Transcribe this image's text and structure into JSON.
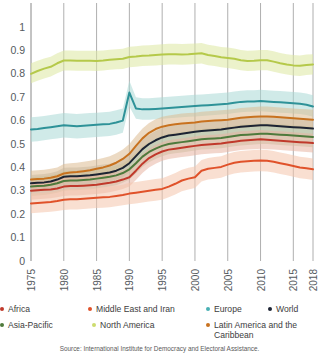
{
  "chart_data": {
    "type": "line",
    "title": "",
    "subtitle": "",
    "xlabel": "",
    "ylabel": "",
    "xlim": [
      1975,
      2018
    ],
    "ylim": [
      0,
      1
    ],
    "grid": "vertical",
    "legend_position": "bottom",
    "y_ticks": [
      "0",
      "0.1",
      "0.2",
      "0.3",
      "0.4",
      "0.5",
      "0.6",
      "0.7",
      "0.8",
      "0.9",
      "1"
    ],
    "x_ticks": [
      "1975",
      "1980",
      "1985",
      "1990",
      "1995",
      "2000",
      "2005",
      "2010",
      "2015",
      "2018"
    ],
    "x": [
      1975,
      1976,
      1977,
      1978,
      1979,
      1980,
      1981,
      1982,
      1983,
      1984,
      1985,
      1986,
      1987,
      1988,
      1989,
      1990,
      1991,
      1992,
      1993,
      1994,
      1995,
      1996,
      1997,
      1998,
      1999,
      2000,
      2001,
      2002,
      2003,
      2004,
      2005,
      2006,
      2007,
      2008,
      2009,
      2010,
      2011,
      2012,
      2013,
      2014,
      2015,
      2016,
      2017,
      2018
    ],
    "series": [
      {
        "name": "North America",
        "color": "#b5c94a",
        "band_color": "#dce8a0",
        "values": [
          0.8,
          0.812,
          0.822,
          0.83,
          0.845,
          0.857,
          0.857,
          0.856,
          0.856,
          0.856,
          0.855,
          0.857,
          0.86,
          0.862,
          0.864,
          0.872,
          0.874,
          0.877,
          0.878,
          0.88,
          0.882,
          0.884,
          0.884,
          0.883,
          0.884,
          0.886,
          0.888,
          0.88,
          0.876,
          0.871,
          0.868,
          0.864,
          0.858,
          0.855,
          0.856,
          0.858,
          0.858,
          0.852,
          0.845,
          0.84,
          0.836,
          0.834,
          0.838,
          0.84
        ],
        "band_low": [
          0.76,
          0.77,
          0.78,
          0.788,
          0.802,
          0.814,
          0.814,
          0.813,
          0.813,
          0.813,
          0.812,
          0.814,
          0.817,
          0.819,
          0.821,
          0.828,
          0.83,
          0.833,
          0.834,
          0.836,
          0.838,
          0.84,
          0.84,
          0.839,
          0.84,
          0.842,
          0.844,
          0.837,
          0.833,
          0.828,
          0.825,
          0.821,
          0.815,
          0.812,
          0.813,
          0.815,
          0.815,
          0.809,
          0.802,
          0.797,
          0.793,
          0.791,
          0.795,
          0.797
        ],
        "band_high": [
          0.845,
          0.856,
          0.865,
          0.873,
          0.888,
          0.9,
          0.9,
          0.899,
          0.899,
          0.899,
          0.898,
          0.9,
          0.903,
          0.905,
          0.907,
          0.916,
          0.918,
          0.921,
          0.922,
          0.924,
          0.926,
          0.928,
          0.928,
          0.927,
          0.928,
          0.93,
          0.932,
          0.924,
          0.92,
          0.915,
          0.912,
          0.908,
          0.902,
          0.899,
          0.9,
          0.902,
          0.902,
          0.896,
          0.889,
          0.884,
          0.88,
          0.878,
          0.882,
          0.884
        ]
      },
      {
        "name": "Europe",
        "color": "#2e9298",
        "band_color": "#a9d8d6",
        "values": [
          0.562,
          0.564,
          0.568,
          0.572,
          0.576,
          0.58,
          0.578,
          0.576,
          0.578,
          0.58,
          0.582,
          0.584,
          0.586,
          0.592,
          0.6,
          0.72,
          0.652,
          0.648,
          0.648,
          0.65,
          0.652,
          0.654,
          0.656,
          0.658,
          0.66,
          0.662,
          0.664,
          0.666,
          0.668,
          0.67,
          0.672,
          0.676,
          0.68,
          0.682,
          0.682,
          0.684,
          0.682,
          0.68,
          0.678,
          0.676,
          0.674,
          0.672,
          0.668,
          0.66
        ],
        "band_low": [
          0.51,
          0.512,
          0.516,
          0.52,
          0.524,
          0.528,
          0.526,
          0.524,
          0.526,
          0.528,
          0.53,
          0.532,
          0.534,
          0.54,
          0.548,
          0.66,
          0.608,
          0.604,
          0.604,
          0.606,
          0.608,
          0.61,
          0.612,
          0.614,
          0.616,
          0.618,
          0.62,
          0.622,
          0.624,
          0.626,
          0.628,
          0.632,
          0.636,
          0.638,
          0.638,
          0.64,
          0.638,
          0.636,
          0.634,
          0.632,
          0.63,
          0.628,
          0.624,
          0.616
        ],
        "band_high": [
          0.614,
          0.616,
          0.62,
          0.624,
          0.628,
          0.632,
          0.63,
          0.628,
          0.63,
          0.632,
          0.634,
          0.636,
          0.638,
          0.644,
          0.652,
          0.77,
          0.7,
          0.696,
          0.696,
          0.698,
          0.7,
          0.702,
          0.704,
          0.706,
          0.708,
          0.71,
          0.712,
          0.714,
          0.716,
          0.718,
          0.72,
          0.724,
          0.728,
          0.73,
          0.73,
          0.732,
          0.73,
          0.728,
          0.726,
          0.724,
          0.722,
          0.72,
          0.716,
          0.708
        ]
      },
      {
        "name": "World",
        "color": "#1d2433",
        "band_color": "#b7b7ad",
        "values": [
          0.332,
          0.334,
          0.336,
          0.34,
          0.348,
          0.36,
          0.362,
          0.362,
          0.364,
          0.366,
          0.37,
          0.374,
          0.378,
          0.386,
          0.398,
          0.418,
          0.448,
          0.478,
          0.5,
          0.516,
          0.528,
          0.536,
          0.54,
          0.544,
          0.548,
          0.552,
          0.556,
          0.558,
          0.56,
          0.562,
          0.566,
          0.57,
          0.574,
          0.576,
          0.578,
          0.58,
          0.58,
          0.578,
          0.576,
          0.574,
          0.572,
          0.57,
          0.568,
          0.566
        ],
        "band_low": [
          0.296,
          0.298,
          0.3,
          0.304,
          0.312,
          0.322,
          0.324,
          0.324,
          0.326,
          0.328,
          0.332,
          0.336,
          0.34,
          0.348,
          0.358,
          0.378,
          0.408,
          0.438,
          0.46,
          0.476,
          0.488,
          0.496,
          0.5,
          0.504,
          0.508,
          0.512,
          0.516,
          0.518,
          0.52,
          0.522,
          0.526,
          0.53,
          0.534,
          0.536,
          0.538,
          0.54,
          0.54,
          0.538,
          0.536,
          0.534,
          0.532,
          0.53,
          0.528,
          0.526
        ],
        "band_high": [
          0.368,
          0.37,
          0.372,
          0.376,
          0.384,
          0.398,
          0.4,
          0.4,
          0.402,
          0.404,
          0.408,
          0.412,
          0.416,
          0.424,
          0.438,
          0.458,
          0.488,
          0.518,
          0.54,
          0.556,
          0.568,
          0.576,
          0.58,
          0.584,
          0.588,
          0.592,
          0.596,
          0.598,
          0.6,
          0.602,
          0.606,
          0.61,
          0.614,
          0.616,
          0.618,
          0.62,
          0.62,
          0.618,
          0.616,
          0.614,
          0.612,
          0.61,
          0.608,
          0.606
        ]
      },
      {
        "name": "Asia-Pacific",
        "color": "#4e7a3c",
        "band_color": "#b9c8a2",
        "values": [
          0.318,
          0.32,
          0.322,
          0.326,
          0.332,
          0.342,
          0.344,
          0.344,
          0.346,
          0.348,
          0.352,
          0.356,
          0.36,
          0.366,
          0.376,
          0.392,
          0.418,
          0.446,
          0.466,
          0.48,
          0.492,
          0.5,
          0.504,
          0.508,
          0.512,
          0.516,
          0.52,
          0.522,
          0.524,
          0.526,
          0.53,
          0.534,
          0.538,
          0.54,
          0.542,
          0.544,
          0.544,
          0.542,
          0.54,
          0.538,
          0.536,
          0.534,
          0.532,
          0.53
        ],
        "band_low": [
          0.278,
          0.28,
          0.282,
          0.286,
          0.292,
          0.3,
          0.302,
          0.302,
          0.304,
          0.306,
          0.31,
          0.314,
          0.318,
          0.324,
          0.334,
          0.348,
          0.374,
          0.402,
          0.422,
          0.436,
          0.448,
          0.456,
          0.46,
          0.464,
          0.468,
          0.472,
          0.476,
          0.478,
          0.48,
          0.482,
          0.486,
          0.49,
          0.494,
          0.496,
          0.498,
          0.5,
          0.5,
          0.498,
          0.496,
          0.494,
          0.492,
          0.49,
          0.488,
          0.486
        ],
        "band_high": [
          0.358,
          0.36,
          0.362,
          0.366,
          0.372,
          0.384,
          0.386,
          0.386,
          0.388,
          0.39,
          0.394,
          0.398,
          0.402,
          0.408,
          0.418,
          0.436,
          0.462,
          0.49,
          0.51,
          0.524,
          0.536,
          0.544,
          0.548,
          0.552,
          0.556,
          0.56,
          0.564,
          0.566,
          0.568,
          0.57,
          0.574,
          0.578,
          0.582,
          0.584,
          0.586,
          0.588,
          0.588,
          0.586,
          0.584,
          0.582,
          0.58,
          0.578,
          0.576,
          0.574
        ]
      },
      {
        "name": "Latin America and the Caribbean",
        "color": "#c8721f",
        "band_color": "#ddbc92",
        "values": [
          0.348,
          0.35,
          0.352,
          0.356,
          0.362,
          0.374,
          0.378,
          0.38,
          0.384,
          0.388,
          0.394,
          0.4,
          0.408,
          0.42,
          0.436,
          0.458,
          0.492,
          0.524,
          0.548,
          0.564,
          0.574,
          0.58,
          0.584,
          0.588,
          0.59,
          0.592,
          0.596,
          0.598,
          0.6,
          0.602,
          0.604,
          0.608,
          0.612,
          0.614,
          0.616,
          0.618,
          0.618,
          0.616,
          0.614,
          0.612,
          0.61,
          0.608,
          0.606,
          0.604
        ],
        "band_low": [
          0.31,
          0.312,
          0.314,
          0.318,
          0.324,
          0.334,
          0.338,
          0.34,
          0.344,
          0.348,
          0.354,
          0.36,
          0.368,
          0.38,
          0.396,
          0.416,
          0.45,
          0.482,
          0.506,
          0.522,
          0.532,
          0.538,
          0.542,
          0.546,
          0.548,
          0.55,
          0.554,
          0.556,
          0.558,
          0.56,
          0.562,
          0.566,
          0.57,
          0.572,
          0.574,
          0.576,
          0.576,
          0.574,
          0.572,
          0.57,
          0.568,
          0.566,
          0.564,
          0.562
        ],
        "band_high": [
          0.386,
          0.388,
          0.39,
          0.394,
          0.4,
          0.414,
          0.418,
          0.42,
          0.424,
          0.428,
          0.434,
          0.44,
          0.448,
          0.46,
          0.476,
          0.5,
          0.534,
          0.566,
          0.59,
          0.606,
          0.616,
          0.622,
          0.626,
          0.63,
          0.632,
          0.634,
          0.638,
          0.64,
          0.642,
          0.644,
          0.646,
          0.65,
          0.654,
          0.656,
          0.658,
          0.66,
          0.66,
          0.658,
          0.656,
          0.654,
          0.652,
          0.65,
          0.648,
          0.646
        ]
      },
      {
        "name": "Africa",
        "color": "#c0392b",
        "band_color": "#e8b5a2",
        "values": [
          0.3,
          0.302,
          0.304,
          0.306,
          0.31,
          0.318,
          0.32,
          0.32,
          0.322,
          0.324,
          0.326,
          0.33,
          0.334,
          0.34,
          0.348,
          0.358,
          0.386,
          0.416,
          0.44,
          0.456,
          0.468,
          0.476,
          0.48,
          0.484,
          0.488,
          0.492,
          0.496,
          0.498,
          0.5,
          0.502,
          0.506,
          0.51,
          0.514,
          0.516,
          0.518,
          0.52,
          0.518,
          0.516,
          0.514,
          0.512,
          0.51,
          0.508,
          0.506,
          0.504
        ],
        "band_low": [
          0.262,
          0.264,
          0.266,
          0.268,
          0.272,
          0.278,
          0.28,
          0.28,
          0.282,
          0.284,
          0.286,
          0.29,
          0.294,
          0.3,
          0.308,
          0.318,
          0.346,
          0.376,
          0.4,
          0.416,
          0.428,
          0.436,
          0.44,
          0.444,
          0.448,
          0.452,
          0.456,
          0.458,
          0.46,
          0.462,
          0.466,
          0.47,
          0.474,
          0.476,
          0.478,
          0.48,
          0.478,
          0.476,
          0.474,
          0.472,
          0.47,
          0.468,
          0.466,
          0.464
        ],
        "band_high": [
          0.338,
          0.34,
          0.342,
          0.344,
          0.348,
          0.358,
          0.36,
          0.36,
          0.362,
          0.364,
          0.366,
          0.37,
          0.374,
          0.38,
          0.388,
          0.398,
          0.426,
          0.456,
          0.48,
          0.496,
          0.508,
          0.516,
          0.52,
          0.524,
          0.528,
          0.532,
          0.536,
          0.538,
          0.54,
          0.542,
          0.546,
          0.55,
          0.554,
          0.556,
          0.558,
          0.56,
          0.558,
          0.556,
          0.554,
          0.552,
          0.55,
          0.548,
          0.546,
          0.544
        ]
      },
      {
        "name": "Middle East and Iran",
        "color": "#e0522a",
        "band_color": "#f4c4ab",
        "values": [
          0.246,
          0.248,
          0.25,
          0.252,
          0.256,
          0.262,
          0.264,
          0.264,
          0.266,
          0.268,
          0.27,
          0.272,
          0.274,
          0.278,
          0.282,
          0.288,
          0.292,
          0.296,
          0.3,
          0.304,
          0.308,
          0.318,
          0.33,
          0.344,
          0.352,
          0.358,
          0.386,
          0.394,
          0.398,
          0.402,
          0.412,
          0.42,
          0.424,
          0.426,
          0.428,
          0.43,
          0.428,
          0.424,
          0.418,
          0.412,
          0.406,
          0.4,
          0.396,
          0.392
        ],
        "band_low": [
          0.204,
          0.206,
          0.208,
          0.21,
          0.214,
          0.218,
          0.22,
          0.22,
          0.222,
          0.224,
          0.226,
          0.228,
          0.23,
          0.234,
          0.238,
          0.242,
          0.246,
          0.25,
          0.254,
          0.258,
          0.262,
          0.272,
          0.284,
          0.298,
          0.306,
          0.312,
          0.34,
          0.348,
          0.352,
          0.356,
          0.366,
          0.374,
          0.378,
          0.38,
          0.382,
          0.384,
          0.382,
          0.378,
          0.372,
          0.366,
          0.36,
          0.354,
          0.35,
          0.346
        ],
        "band_high": [
          0.288,
          0.29,
          0.292,
          0.294,
          0.298,
          0.306,
          0.308,
          0.308,
          0.31,
          0.312,
          0.314,
          0.316,
          0.318,
          0.322,
          0.326,
          0.334,
          0.338,
          0.342,
          0.346,
          0.35,
          0.354,
          0.364,
          0.376,
          0.39,
          0.398,
          0.404,
          0.432,
          0.44,
          0.444,
          0.448,
          0.458,
          0.466,
          0.47,
          0.472,
          0.474,
          0.476,
          0.474,
          0.47,
          0.464,
          0.458,
          0.452,
          0.446,
          0.442,
          0.438
        ]
      }
    ]
  },
  "legend": {
    "row1": [
      {
        "label": "Africa",
        "color": "#c0392b"
      },
      {
        "label": "Middle East and Iran",
        "color": "#e0522a"
      },
      {
        "label": "Europe",
        "color": "#49b0b4"
      },
      {
        "label": "World",
        "color": "#1d2433"
      }
    ],
    "row2": [
      {
        "label": "Asia-Pacific",
        "color": "#4e7a3c"
      },
      {
        "label": "North America",
        "color": "#cddc6e"
      },
      {
        "label": "Latin America and the Caribbean",
        "color": "#c8721f"
      }
    ]
  },
  "source": {
    "text": "Source: International Institute for Democracy and Electoral Assistance."
  }
}
